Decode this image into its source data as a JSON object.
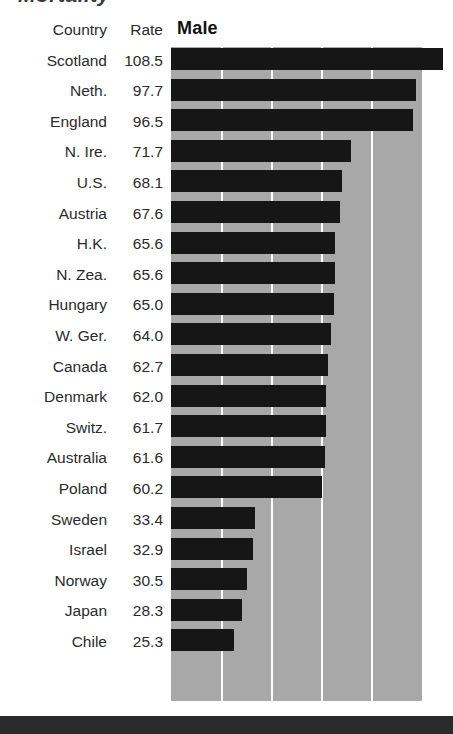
{
  "title_partial": "Mortality",
  "series_title": "Male",
  "columns": {
    "country": "Country",
    "rate": "Rate"
  },
  "bottom_rule_color": "#2a2a2a",
  "colors": {
    "bar": "#161616",
    "plot_background": "#a8a8a8",
    "gridline": "#fdfdfd",
    "text": "#2b2b2b"
  },
  "chart_data": {
    "type": "bar",
    "orientation": "horizontal",
    "title": "Male",
    "xlabel": "Rate",
    "ylabel": "Country",
    "categories": [
      "Scotland",
      "Neth.",
      "England",
      "N. Ire.",
      "U.S.",
      "Austria",
      "H.K.",
      "N. Zea.",
      "Hungary",
      "W. Ger.",
      "Canada",
      "Denmark",
      "Switz.",
      "Australia",
      "Poland",
      "Sweden",
      "Israel",
      "Norway",
      "Japan",
      "Chile"
    ],
    "values": [
      108.5,
      97.7,
      96.5,
      71.7,
      68.1,
      67.6,
      65.6,
      65.6,
      65.0,
      64.0,
      62.7,
      62.0,
      61.7,
      61.6,
      60.2,
      33.4,
      32.9,
      30.5,
      28.3,
      25.3
    ],
    "value_labels": [
      "108.5",
      "97.7",
      "96.5",
      "71.7",
      "68.1",
      "67.6",
      "65.6",
      "65.6",
      "65.0",
      "64.0",
      "62.7",
      "62.0",
      "61.7",
      "61.6",
      "60.2",
      "33.4",
      "32.9",
      "30.5",
      "28.3",
      "25.3"
    ],
    "xlim": [
      0,
      100
    ],
    "gridline_values": [
      20,
      40,
      60,
      80
    ],
    "grid": true,
    "legend": "none",
    "note": "Bars clipped at right edge of image; longest bar (Scotland 108.5) runs past the plot frame."
  },
  "rows": [
    {
      "country": "Scotland",
      "rate": "108.5",
      "value": 108.5
    },
    {
      "country": "Neth.",
      "rate": "97.7",
      "value": 97.7
    },
    {
      "country": "England",
      "rate": "96.5",
      "value": 96.5
    },
    {
      "country": "N. Ire.",
      "rate": "71.7",
      "value": 71.7
    },
    {
      "country": "U.S.",
      "rate": "68.1",
      "value": 68.1
    },
    {
      "country": "Austria",
      "rate": "67.6",
      "value": 67.6
    },
    {
      "country": "H.K.",
      "rate": "65.6",
      "value": 65.6
    },
    {
      "country": "N. Zea.",
      "rate": "65.6",
      "value": 65.6
    },
    {
      "country": "Hungary",
      "rate": "65.0",
      "value": 65.0
    },
    {
      "country": "W. Ger.",
      "rate": "64.0",
      "value": 64.0
    },
    {
      "country": "Canada",
      "rate": "62.7",
      "value": 62.7
    },
    {
      "country": "Denmark",
      "rate": "62.0",
      "value": 62.0
    },
    {
      "country": "Switz.",
      "rate": "61.7",
      "value": 61.7
    },
    {
      "country": "Australia",
      "rate": "61.6",
      "value": 61.6
    },
    {
      "country": "Poland",
      "rate": "60.2",
      "value": 60.2
    },
    {
      "country": "Sweden",
      "rate": "33.4",
      "value": 33.4
    },
    {
      "country": "Israel",
      "rate": "32.9",
      "value": 32.9
    },
    {
      "country": "Norway",
      "rate": "30.5",
      "value": 30.5
    },
    {
      "country": "Japan",
      "rate": "28.3",
      "value": 28.3
    },
    {
      "country": "Chile",
      "rate": "25.3",
      "value": 25.3
    }
  ]
}
